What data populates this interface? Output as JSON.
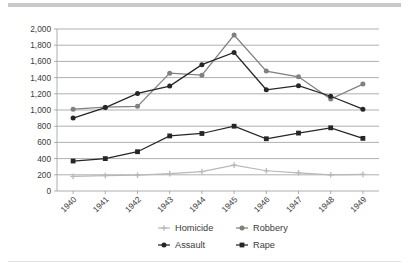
{
  "chart_data": {
    "type": "line",
    "title": "",
    "xlabel": "",
    "ylabel": "",
    "categories": [
      "1940",
      "1941",
      "1942",
      "1943",
      "1944",
      "1945",
      "1946",
      "1947",
      "1948",
      "1949"
    ],
    "ylim": [
      0,
      2000
    ],
    "ytick_labels": [
      "0",
      "200",
      "400",
      "600",
      "800",
      "1,000",
      "1,200",
      "1,400",
      "1,600",
      "1,800",
      "2,000"
    ],
    "ytick_values": [
      0,
      200,
      400,
      600,
      800,
      1000,
      1200,
      1400,
      1600,
      1800,
      2000
    ],
    "grid": true,
    "legend_position": "bottom",
    "series": [
      {
        "name": "Homicide",
        "color": "#b8b8b8",
        "marker": "cross",
        "values": [
          180,
          190,
          195,
          215,
          240,
          320,
          250,
          225,
          200,
          205
        ]
      },
      {
        "name": "Robbery",
        "color": "#808080",
        "marker": "circle",
        "values": [
          1010,
          1035,
          1045,
          1455,
          1430,
          1925,
          1480,
          1410,
          1135,
          1320
        ]
      },
      {
        "name": "Assault",
        "color": "#262626",
        "marker": "circle",
        "values": [
          900,
          1030,
          1205,
          1295,
          1560,
          1710,
          1250,
          1300,
          1170,
          1010
        ]
      },
      {
        "name": "Rape",
        "color": "#262626",
        "marker": "square",
        "values": [
          370,
          400,
          485,
          680,
          710,
          800,
          645,
          715,
          780,
          650
        ]
      }
    ]
  },
  "legend": {
    "entries": [
      {
        "label": "Homicide"
      },
      {
        "label": "Robbery"
      },
      {
        "label": "Assault"
      },
      {
        "label": "Rape"
      }
    ]
  }
}
